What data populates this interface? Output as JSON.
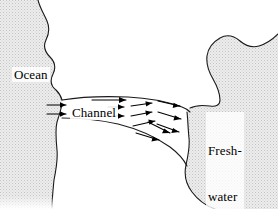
{
  "figure": {
    "width": 278,
    "height": 209,
    "background_color": "#ffffff",
    "line_color": "#000000",
    "land_fill_color": "#e8e8e8",
    "land_stipple_color": "#c9c9c9"
  },
  "labels": {
    "ocean": "Ocean",
    "channel": "Channel",
    "lake_line1": "Fresh-",
    "lake_line2": "water",
    "lake_line3": "lake"
  },
  "regions": [
    {
      "name": "ocean-landmass",
      "label": "Ocean",
      "side": "left",
      "fill": "stippled"
    },
    {
      "name": "lake-landmass",
      "label": "Fresh-water lake",
      "side": "right",
      "fill": "stippled"
    },
    {
      "name": "channel",
      "label": "Channel",
      "side": "center",
      "fill": "white"
    }
  ],
  "flow": {
    "direction": "left-to-right",
    "description": "Arrows point from the ocean through the channel into the freshwater lake, fanning out as the channel widens.",
    "arrow_color": "#000000",
    "arrow_count": 13,
    "groups": [
      {
        "name": "channel-entrance",
        "count": 2,
        "angle_deg": 0
      },
      {
        "name": "channel-throat",
        "count": 3,
        "angle_deg": 0
      },
      {
        "name": "channel-mid",
        "count": 3,
        "angle_deg": 8
      },
      {
        "name": "channel-outflow",
        "count": 3,
        "angle_deg": 18
      },
      {
        "name": "channel-lower",
        "count": 2,
        "angle_deg": 26
      }
    ]
  }
}
